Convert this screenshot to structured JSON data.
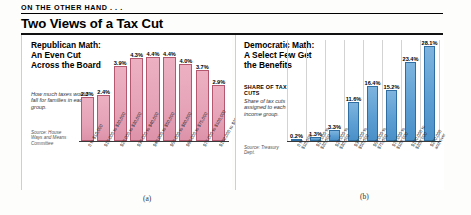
{
  "header": {
    "kicker": "ON THE OTHER HAND . . .",
    "title": "Two Views of a Tax Cut"
  },
  "figures": {
    "a": "(a)",
    "b": "(b)"
  },
  "chart_data": [
    {
      "type": "bar",
      "panel": "a",
      "title": "Republican Math: An Even Cut Across the Board",
      "caption": "How much taxes would fall for families in each group.",
      "source": "Source: House Ways and Means Committee",
      "xlabel": "",
      "ylabel": "",
      "ylim": [
        0,
        5
      ],
      "grid": false,
      "bar_color": "#e6a3b8",
      "bar_edge_color": "#b4586f",
      "categories": [
        "0 to $10,000",
        "$10,000 to $20,000",
        "$20,000 to $30,000",
        "$30,000 to $40,000",
        "$40,000 to $50,000",
        "$50,000 to $60,000",
        "$60,000 to $75,000",
        "$75,000 to $100,000",
        "$100,000 to $200,000",
        "$200,000 and over"
      ],
      "values": [
        2.3,
        2.4,
        3.9,
        4.3,
        4.4,
        4.4,
        4.0,
        3.7,
        2.9
      ],
      "value_labels": [
        "2.3%",
        "2.4%",
        "3.9%",
        "4.3%",
        "4.4%",
        "4.4%",
        "4.0%",
        "3.7%",
        "2.9%"
      ]
    },
    {
      "type": "bar",
      "panel": "b",
      "title": "Democratic Math: A Select Few Get the Benefits",
      "axis_heading": "SHARE OF TAX CUTS",
      "caption": "Share of tax cuts assigned to each income group.",
      "source": "Source: Treasury Dept.",
      "xlabel": "",
      "ylabel": "",
      "ylim": [
        0,
        30
      ],
      "grid": true,
      "bar_color": "#5d9fd3",
      "bar_edge_color": "#2f6ea3",
      "categories": [
        "0 to\n$10,000",
        "$10,000 to\n$20,000",
        "$20,000 to\n$30,000",
        "$30,000 to\n$50,000",
        "$50,000 to\n$75,000",
        "$75,000 to\n$100,000",
        "$100,000 to\n$200,000",
        "$200,000\nand over"
      ],
      "values": [
        0.2,
        1.3,
        3.3,
        11.6,
        16.4,
        15.2,
        23.4,
        28.1
      ],
      "value_labels": [
        "0.2%",
        "1.3%",
        "3.3%",
        "11.6%",
        "16.4%",
        "15.2%",
        "23.4%",
        "28.1%"
      ]
    }
  ]
}
